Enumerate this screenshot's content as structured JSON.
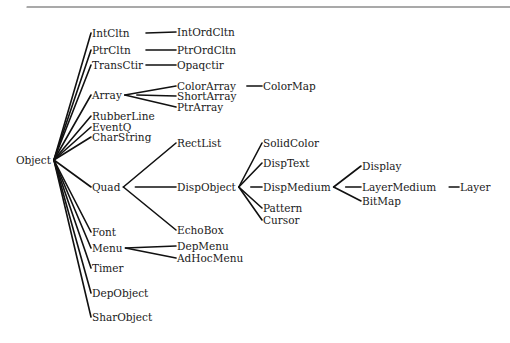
{
  "diagram": {
    "title": "",
    "type": "class-hierarchy-tree",
    "root": "Object",
    "nodes": {
      "object": {
        "label": "Object",
        "x": 16,
        "y": 160
      },
      "intcltn": {
        "label": "IntCltn",
        "x": 92,
        "y": 33
      },
      "ptrcltn": {
        "label": "PtrCltn",
        "x": 92,
        "y": 50
      },
      "transctir": {
        "label": "TransCtir",
        "x": 92,
        "y": 65
      },
      "array": {
        "label": "Array",
        "x": 92,
        "y": 95
      },
      "rubberline": {
        "label": "RubberLine",
        "x": 92,
        "y": 116
      },
      "eventq": {
        "label": "EventQ",
        "x": 92,
        "y": 127
      },
      "charstring": {
        "label": "CharString",
        "x": 92,
        "y": 137
      },
      "quad": {
        "label": "Quad",
        "x": 92,
        "y": 187
      },
      "font": {
        "label": "Font",
        "x": 92,
        "y": 232
      },
      "menu": {
        "label": "Menu",
        "x": 92,
        "y": 248
      },
      "timer": {
        "label": "Timer",
        "x": 92,
        "y": 268
      },
      "depobject": {
        "label": "DepObject",
        "x": 92,
        "y": 293
      },
      "sharobject": {
        "label": "SharObject",
        "x": 92,
        "y": 317
      },
      "intordcltn": {
        "label": "IntOrdCltn",
        "x": 177,
        "y": 32
      },
      "ptrordcltn": {
        "label": "PtrOrdCltn",
        "x": 177,
        "y": 50
      },
      "opaqctir": {
        "label": "Opaqctir",
        "x": 177,
        "y": 65
      },
      "colorarray": {
        "label": "ColorArray",
        "x": 177,
        "y": 86
      },
      "shortarray": {
        "label": "ShortArray",
        "x": 177,
        "y": 96
      },
      "ptrarray": {
        "label": "PtrArray",
        "x": 177,
        "y": 107
      },
      "rectlist": {
        "label": "RectList",
        "x": 177,
        "y": 143
      },
      "dispobject": {
        "label": "DispObject",
        "x": 177,
        "y": 187
      },
      "echobox": {
        "label": "EchoBox",
        "x": 177,
        "y": 230
      },
      "depmenu": {
        "label": "DepMenu",
        "x": 177,
        "y": 246
      },
      "adhocmenu": {
        "label": "AdHocMenu",
        "x": 177,
        "y": 258
      },
      "colormap": {
        "label": "ColorMap",
        "x": 263,
        "y": 86
      },
      "solidcolor": {
        "label": "SolidColor",
        "x": 263,
        "y": 143
      },
      "disptext": {
        "label": "DispText",
        "x": 263,
        "y": 163
      },
      "dispmedium": {
        "label": "DispMedium",
        "x": 263,
        "y": 187
      },
      "pattern": {
        "label": "Pattern",
        "x": 263,
        "y": 208
      },
      "cursor": {
        "label": "Cursor",
        "x": 263,
        "y": 220
      },
      "display": {
        "label": "Display",
        "x": 362,
        "y": 166
      },
      "layermedium": {
        "label": "LayerMedium",
        "x": 362,
        "y": 187
      },
      "bitmap": {
        "label": "BitMap",
        "x": 362,
        "y": 201
      },
      "layer": {
        "label": "Layer",
        "x": 460,
        "y": 187
      }
    },
    "edges": [
      [
        "object",
        "intcltn"
      ],
      [
        "object",
        "ptrcltn"
      ],
      [
        "object",
        "transctir"
      ],
      [
        "object",
        "array"
      ],
      [
        "object",
        "rubberline"
      ],
      [
        "object",
        "eventq"
      ],
      [
        "object",
        "charstring"
      ],
      [
        "object",
        "quad"
      ],
      [
        "object",
        "font"
      ],
      [
        "object",
        "menu"
      ],
      [
        "object",
        "timer"
      ],
      [
        "object",
        "depobject"
      ],
      [
        "object",
        "sharobject"
      ],
      [
        "intcltn",
        "intordcltn"
      ],
      [
        "ptrcltn",
        "ptrordcltn"
      ],
      [
        "transctir",
        "opaqctir"
      ],
      [
        "array",
        "colorarray"
      ],
      [
        "array",
        "shortarray"
      ],
      [
        "array",
        "ptrarray"
      ],
      [
        "colorarray",
        "colormap"
      ],
      [
        "quad",
        "rectlist"
      ],
      [
        "quad",
        "dispobject"
      ],
      [
        "quad",
        "echobox"
      ],
      [
        "menu",
        "depmenu"
      ],
      [
        "menu",
        "adhocmenu"
      ],
      [
        "dispobject",
        "solidcolor"
      ],
      [
        "dispobject",
        "disptext"
      ],
      [
        "dispobject",
        "dispmedium"
      ],
      [
        "dispobject",
        "pattern"
      ],
      [
        "dispobject",
        "cursor"
      ],
      [
        "dispmedium",
        "display"
      ],
      [
        "dispmedium",
        "layermedium"
      ],
      [
        "dispmedium",
        "bitmap"
      ],
      [
        "layermedium",
        "layer"
      ]
    ]
  }
}
